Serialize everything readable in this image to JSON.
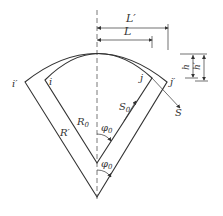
{
  "diagram": {
    "labels": {
      "L_prime": "L′",
      "L": "L",
      "h": "h",
      "h_prime": "h′",
      "i_prime": "i′",
      "i": "i",
      "j": "j",
      "j_prime": "j′",
      "S": "S",
      "S0": "S",
      "S0_sub": "0",
      "R0": "R",
      "R0_sub": "0",
      "R_prime": "R′",
      "phi0_upper": "φ",
      "phi0_upper_sub": "0",
      "phi0_lower": "φ",
      "phi0_lower_sub": "0"
    },
    "colors": {
      "line": "#333333",
      "dash": "#555555"
    }
  }
}
